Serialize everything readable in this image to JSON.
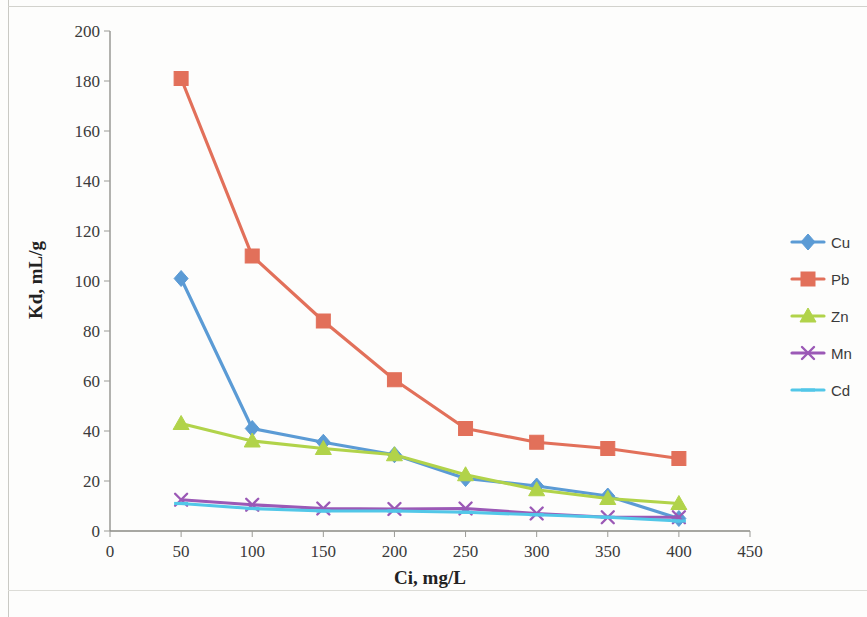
{
  "chart_data": {
    "type": "line",
    "title": "",
    "xlabel": "Ci, mg/L",
    "ylabel": "Kd, mL/g",
    "x": [
      50,
      100,
      150,
      200,
      250,
      300,
      350,
      400
    ],
    "xlim": [
      0,
      450
    ],
    "ylim": [
      0,
      200
    ],
    "xticks": [
      "0",
      "50",
      "100",
      "150",
      "200",
      "250",
      "300",
      "350",
      "400",
      "450"
    ],
    "xtick_values": [
      0,
      50,
      100,
      150,
      200,
      250,
      300,
      350,
      400,
      450
    ],
    "yticks": [
      "0",
      "20",
      "40",
      "60",
      "80",
      "100",
      "120",
      "140",
      "160",
      "180",
      "200"
    ],
    "ytick_values": [
      0,
      20,
      40,
      60,
      80,
      100,
      120,
      140,
      160,
      180,
      200
    ],
    "grid": false,
    "legend_position": "right",
    "series": [
      {
        "name": "Cu",
        "color": "#5b9bd5",
        "marker": "diamond",
        "values": [
          101,
          41,
          35.5,
          30.5,
          21,
          18,
          14,
          5
        ]
      },
      {
        "name": "Pb",
        "color": "#e2705a",
        "marker": "square",
        "values": [
          181,
          110,
          84,
          60.5,
          41,
          35.5,
          33,
          29
        ]
      },
      {
        "name": "Zn",
        "color": "#b1d34a",
        "marker": "triangle",
        "values": [
          43,
          36,
          33,
          30.5,
          22.5,
          16.5,
          13,
          11
        ]
      },
      {
        "name": "Mn",
        "color": "#9b59b6",
        "marker": "x",
        "values": [
          12.5,
          10.5,
          9,
          8.8,
          9,
          7,
          5.5,
          5.5
        ]
      },
      {
        "name": "Cd",
        "color": "#52c7e8",
        "marker": "dash",
        "values": [
          11,
          9,
          8,
          8,
          7.5,
          6.5,
          5.5,
          4
        ]
      }
    ]
  },
  "legend": {
    "entries": [
      {
        "label": "Cu"
      },
      {
        "label": "Pb"
      },
      {
        "label": "Zn"
      },
      {
        "label": "Mn"
      },
      {
        "label": "Cd"
      }
    ]
  }
}
